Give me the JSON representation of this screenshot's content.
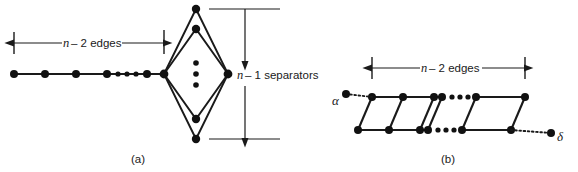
{
  "figure": {
    "panels": [
      {
        "id": "a",
        "caption": "(a)",
        "dimension_label_prefix": "n",
        "dimension_label_rest": " – 2 edges",
        "separator_label_prefix": "n",
        "separator_label_rest": " – 1 separators",
        "chain_nodes": 4,
        "chain_ellipsis_dots": 3,
        "lens_upper_nodes": 2,
        "lens_lower_nodes": 2,
        "lens_vertical_ellipsis_dots": 3
      },
      {
        "id": "b",
        "caption": "(b)",
        "dimension_label_prefix": "n",
        "dimension_label_rest": " – 2 edges",
        "left_terminal_label": "α",
        "right_terminal_label": "δ",
        "rungs_left_group": 4,
        "rungs_right_group": 2,
        "top_ellipsis_dots": 3,
        "bottom_ellipsis_dots": 3
      }
    ],
    "colors": {
      "ink": "#1a1a1a",
      "node": "#111111",
      "background": "#ffffff"
    }
  }
}
